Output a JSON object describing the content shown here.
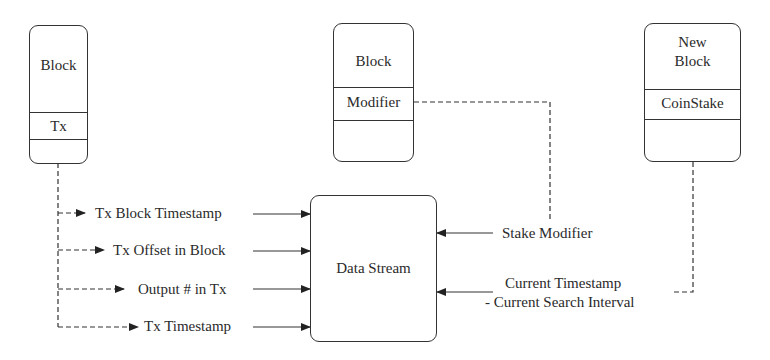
{
  "blocks": {
    "left": {
      "title": "Block",
      "field": "Tx"
    },
    "middle": {
      "title": "Block",
      "field": "Modifier"
    },
    "right": {
      "title_line1": "New",
      "title_line2": "Block",
      "field": "CoinStake"
    }
  },
  "data_stream": {
    "label": "Data Stream"
  },
  "inputs_left": [
    {
      "label": "Tx Block Timestamp"
    },
    {
      "label": "Tx Offset in Block"
    },
    {
      "label": "Output # in Tx"
    },
    {
      "label": "Tx Timestamp"
    }
  ],
  "inputs_right": [
    {
      "label": "Stake Modifier"
    },
    {
      "label_line1": "Current Timestamp",
      "label_line2": "- Current Search Interval"
    }
  ],
  "colors": {
    "line": "#333333",
    "text": "#2a2a2a",
    "background": "#ffffff"
  }
}
